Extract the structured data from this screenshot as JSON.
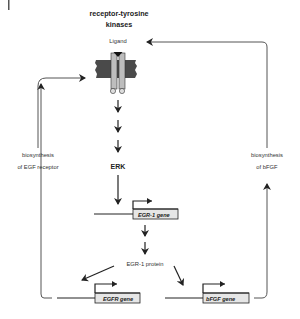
{
  "diagram": {
    "title_line1": "receptor-tyrosine",
    "title_line2": "kinases",
    "ligand_label": "Ligand",
    "erk_label": "ERK",
    "egr1_gene_label": "EGR-1 gene",
    "egr1_protein_label": "EGR-1 protein",
    "egfr_gene_label": "EGFR gene",
    "bfgf_gene_label": "bFGF gene",
    "left_loop_line1": "biosynthesis",
    "left_loop_line2": "of EGF receptor",
    "right_loop_line1": "biosynthesis",
    "right_loop_line2": "of bFGF"
  },
  "colors": {
    "membrane": "#4a4a4a",
    "receptor": "#bdbdbd",
    "gene_box": "#e6e6e6",
    "line": "#555555",
    "text": "#222222"
  }
}
